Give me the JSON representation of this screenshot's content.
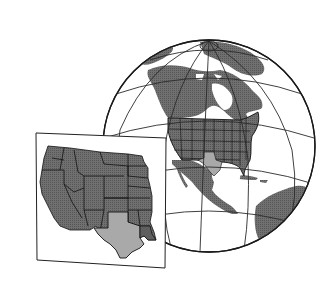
{
  "illustration": {
    "description": "Globe centered on North America with the contiguous United States outlined by state and Texas highlighted; inset map of the western and central United States with Texas highlighted",
    "globe": {
      "region": "North America",
      "highlighted_country": "United States",
      "highlighted_state": "Texas"
    },
    "inset": {
      "region": "Western and Central United States",
      "highlighted_state": "Texas"
    }
  },
  "colors": {
    "background": "#ffffff",
    "land": "#6b6b6b",
    "land_stipple": "#585858",
    "highlight": "#a9a9a9",
    "ocean": "#ffffff",
    "outline": "#1a1a1a",
    "graticule": "#2a2a2a"
  }
}
